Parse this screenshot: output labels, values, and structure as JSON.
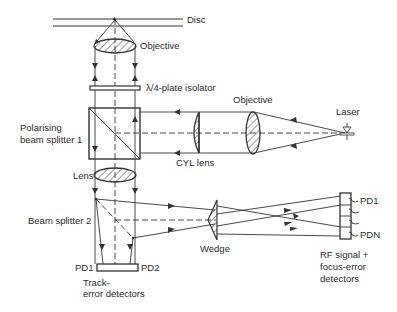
{
  "diagram": {
    "type": "optical-pickup-schematic",
    "labels": {
      "disc": "Disc",
      "objective_top": "Objective",
      "quarter_wave": "λ/4-plate isolator",
      "objective_right": "Objective",
      "laser": "Laser",
      "pbs_line1": "Polarising",
      "pbs_line2": "beam splitter 1",
      "cyl_lens": "CYL lens",
      "lens": "Lens",
      "bs2": "Beam splitter 2",
      "wedge": "Wedge",
      "pd1_array": "PD1",
      "pdn_array": "PDN",
      "rf_line1": "RF signal +",
      "rf_line2": "focus-error",
      "rf_line3": "detectors",
      "track_pd1": "PD1",
      "track_pd2": "PD2",
      "track_line1": "Track-",
      "track_line2": "error detectors"
    },
    "components": [
      "disc",
      "objective-lens-top",
      "quarter-wave-plate",
      "polarising-beam-splitter-1",
      "cylindrical-lens",
      "objective-lens-right",
      "laser-diode",
      "lens",
      "beam-splitter-2",
      "wedge",
      "rf-focus-detector-array",
      "track-error-detectors"
    ],
    "colors": {
      "ink": "#333333",
      "background": "#ffffff"
    }
  }
}
